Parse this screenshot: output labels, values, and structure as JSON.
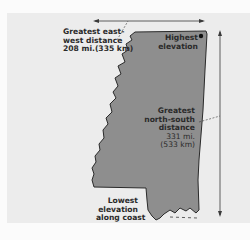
{
  "diagram": {
    "colors": {
      "background": "#ececec",
      "land_fill": "#8e8e8e",
      "outline": "#2a2a2a",
      "text": "#2a2a2a",
      "arrow": "#3a3a3a",
      "point": "#111111"
    },
    "labels": {
      "east_west": {
        "line1": "Greatest east-",
        "line2": "west distance",
        "line3": "208 mi.(335 km)"
      },
      "highest": {
        "line1": "Highest",
        "line2": "elevation"
      },
      "north_south": {
        "line1": "Greatest",
        "line2": "north-south",
        "line3": "distance",
        "line4": "331 mi.",
        "line5": "(533 km)"
      },
      "lowest": {
        "line1": "Lowest",
        "line2": "elevation",
        "line3": "along coast"
      }
    },
    "measurements": [
      {
        "name": "Greatest east-west distance",
        "miles": 208,
        "km": 335,
        "direction": "horizontal"
      },
      {
        "name": "Greatest north-south distance",
        "miles": 331,
        "km": 533,
        "direction": "vertical"
      }
    ],
    "markers": [
      {
        "name": "Highest elevation",
        "type": "point"
      },
      {
        "name": "Lowest elevation along coast",
        "type": "coastline"
      }
    ]
  }
}
